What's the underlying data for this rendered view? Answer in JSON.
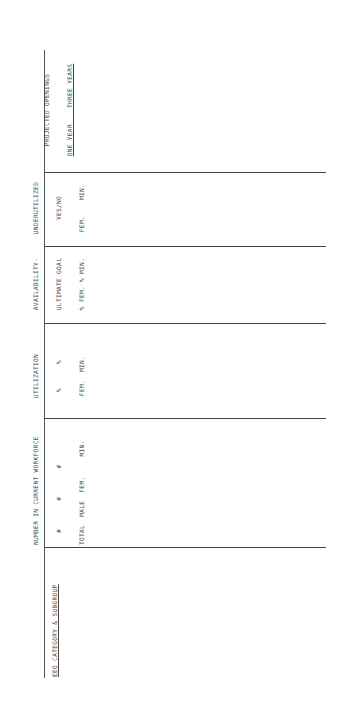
{
  "document": {
    "orientation": "rotated-90-ccw",
    "line_color": "#444444",
    "text_color": "#4a4a4a"
  },
  "columns": [
    {
      "id": "eeo_category",
      "label": "EEO CATEGORY & SUBGROUP"
    },
    {
      "id": "current_workforce",
      "title": "NUMBER IN CURRENT WORKFORCE",
      "symbols": "#       #       #",
      "sub": [
        "TOTAL",
        "MALE",
        "FEM.",
        "MIN."
      ],
      "subline": "TOTAL  MALE  FEM.     MIN."
    },
    {
      "id": "utilization",
      "title": "UTILIZATION",
      "symbols": "%      %",
      "subline": "FEM.  MIN."
    },
    {
      "id": "availability",
      "title": "AVAILABILITY-",
      "title2": "ULTIMATE GOAL",
      "subline": "% FEM. % MIN."
    },
    {
      "id": "underutilized",
      "title": "UNDERUTILIZED",
      "title2": "YES/NO",
      "subline": "FEM.    MIN."
    },
    {
      "id": "projected_openings",
      "title": "PROJECTED OPENINGS",
      "subline": "ONE YEAR    THREE YEARS"
    }
  ],
  "rows": []
}
